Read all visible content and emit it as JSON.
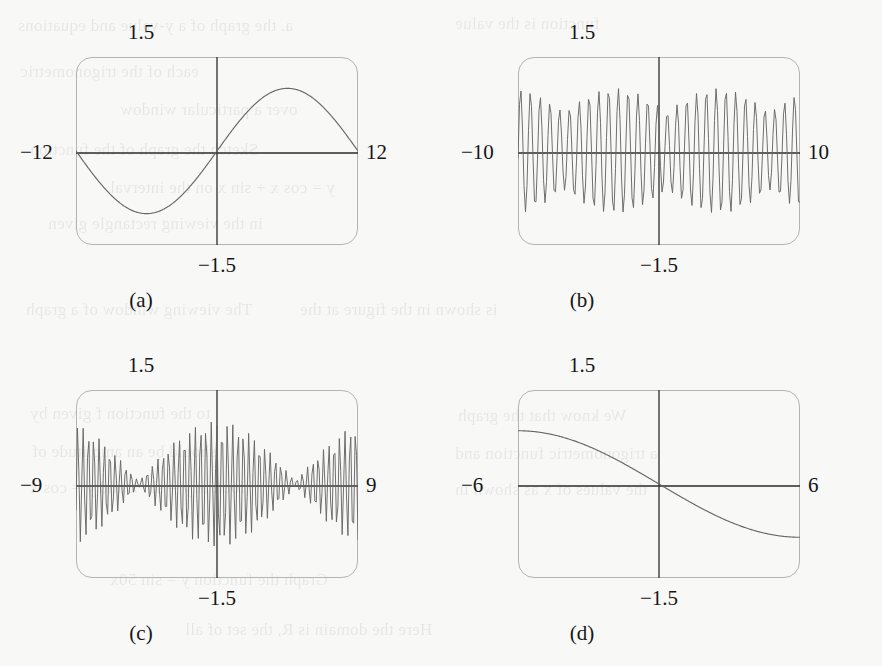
{
  "figure": {
    "background_color": "#f8f8f7",
    "curve_color": "#676767",
    "axis_color": "#2b2b2b",
    "frame_color": "#b4b4b4",
    "panel_count": 4
  },
  "ghost_text": [
    {
      "text": "a. the graph of a y-value and equations",
      "x": 18,
      "y": 16
    },
    {
      "text": "function is the value",
      "x": 455,
      "y": 14
    },
    {
      "text": "each of the trigonometric",
      "x": 20,
      "y": 62
    },
    {
      "text": "over a particular window",
      "x": 120,
      "y": 100
    },
    {
      "text": "Sketch the graph of the function",
      "x": 30,
      "y": 140
    },
    {
      "text": "y = cos x + sin x on the interval",
      "x": 110,
      "y": 178
    },
    {
      "text": "in the viewing rectangle given",
      "x": 48,
      "y": 214
    },
    {
      "text": "The viewing window of a graph",
      "x": 26,
      "y": 300
    },
    {
      "text": "is shown in the figure at the",
      "x": 300,
      "y": 300
    },
    {
      "text": "to the function f given by",
      "x": 30,
      "y": 404
    },
    {
      "text": "We know that the graph",
      "x": 458,
      "y": 406
    },
    {
      "text": "should be an amplitude of",
      "x": 32,
      "y": 442
    },
    {
      "text": "a trigonometric function and",
      "x": 455,
      "y": 444
    },
    {
      "text": "look at y = sin x and y = cos x",
      "x": 30,
      "y": 478
    },
    {
      "text": "the values of x as shown in",
      "x": 455,
      "y": 480
    },
    {
      "text": "Graph the function y = sin 50x",
      "x": 110,
      "y": 570
    },
    {
      "text": "Here the domain is R, the set of all",
      "x": 185,
      "y": 620
    }
  ],
  "panels": [
    {
      "id": "a",
      "caption": "(a)",
      "labels": {
        "ymax": "1.5",
        "ymin": "−1.5",
        "xmin": "−12",
        "xmax": "12"
      }
    },
    {
      "id": "b",
      "caption": "(b)",
      "labels": {
        "ymax": "1.5",
        "ymin": "−1.5",
        "xmin": "−10",
        "xmax": "10"
      }
    },
    {
      "id": "c",
      "caption": "(c)",
      "labels": {
        "ymax": "1.5",
        "ymin": "−1.5",
        "xmin": "−9",
        "xmax": "9"
      }
    },
    {
      "id": "d",
      "caption": "(d)",
      "labels": {
        "ymax": "1.5",
        "ymin": "−1.5",
        "xmin": "−6",
        "xmax": "6"
      }
    }
  ],
  "chart_data": [
    {
      "type": "line",
      "title": "(a)",
      "xlabel": "",
      "ylabel": "",
      "xlim": [
        -12,
        12
      ],
      "ylim": [
        -1.5,
        1.5
      ],
      "grid": false,
      "legend": "none",
      "axis_labels": {
        "left": "−12",
        "right": "12",
        "top": "1.5",
        "bottom": "−1.5"
      },
      "description": "Single smooth sine period across the window; crosses zero at x=0 rising, minimum near x=-6, maximum near x=+6, amplitude about 1.0",
      "series": [
        {
          "name": "y = sin(50x) aliased over [-12,12]",
          "form": "sine",
          "amplitude": 1.0,
          "period": 24,
          "phase": 0,
          "samples_x": [
            -12,
            -10.5,
            -9,
            -7.5,
            -6,
            -4.5,
            -3,
            -1.5,
            0,
            1.5,
            3,
            4.5,
            6,
            7.5,
            9,
            10.5,
            12
          ],
          "samples_y": [
            0,
            -0.383,
            -0.707,
            -0.924,
            -1.0,
            -0.924,
            -0.707,
            -0.383,
            0,
            0.383,
            0.707,
            0.924,
            1.0,
            0.924,
            0.707,
            0.383,
            0
          ]
        }
      ]
    },
    {
      "type": "line",
      "title": "(b)",
      "xlabel": "",
      "ylabel": "",
      "xlim": [
        -10,
        10
      ],
      "ylim": [
        -1.5,
        1.5
      ],
      "grid": false,
      "legend": "none",
      "axis_labels": {
        "left": "−10",
        "right": "10",
        "top": "1.5",
        "bottom": "−1.5"
      },
      "description": "Very dense high-frequency oscillation filling the window; amplitude envelope beats, dipping near x=-3 and x=+4 and peaking near x=-6, x=0 and x=+8; peak amplitude about 1.0",
      "series": [
        {
          "name": "y = sin(50x) sampled (aliased)",
          "form": "aliased-sine",
          "carrier_frequency": 50,
          "envelope_form": "beat",
          "envelope_nodes_x": [
            -3.1,
            4.2
          ],
          "amplitude": 1.0
        }
      ]
    },
    {
      "type": "line",
      "title": "(c)",
      "xlabel": "",
      "ylabel": "",
      "xlim": [
        -9,
        9
      ],
      "ylim": [
        -1.5,
        1.5
      ],
      "grid": false,
      "legend": "none",
      "axis_labels": {
        "left": "−9",
        "right": "9",
        "top": "1.5",
        "bottom": "−1.5"
      },
      "description": "Dense oscillation with a clear symmetric beat envelope: amplitude maximum about 1.0 at x=0, nodes (near-zero amplitude) at about x=-5 and x=+5, secondary lobes rising again toward both edges",
      "series": [
        {
          "name": "y = sin(50x) sampled (aliased, beat envelope)",
          "form": "aliased-sine",
          "carrier_frequency": 50,
          "envelope_form": "cosine-beat",
          "envelope_nodes_x": [
            -5.0,
            5.0
          ],
          "amplitude": 1.0
        }
      ]
    },
    {
      "type": "line",
      "title": "(d)",
      "xlabel": "",
      "ylabel": "",
      "xlim": [
        -6,
        6
      ],
      "ylim": [
        -1.5,
        1.5
      ],
      "grid": false,
      "legend": "none",
      "axis_labels": {
        "left": "−6",
        "right": "6",
        "top": "1.5",
        "bottom": "−1.5"
      },
      "description": "Single smooth monotonically decreasing S-curve; starts flat near y=+0.85 at the left edge, passes through the origin with steepest slope, flattens near y=-0.85 at the right edge",
      "series": [
        {
          "name": "y = sin(50x) aliased over [-6,6] (decreasing sigmoid)",
          "form": "negative-sine-half-period",
          "amplitude": 0.85,
          "samples_x": [
            -6,
            -5,
            -4,
            -3,
            -2,
            -1,
            0,
            1,
            2,
            3,
            4,
            5,
            6
          ],
          "samples_y": [
            0.85,
            0.83,
            0.74,
            0.6,
            0.42,
            0.22,
            0,
            -0.22,
            -0.42,
            -0.6,
            -0.74,
            -0.83,
            -0.85
          ]
        }
      ]
    }
  ]
}
